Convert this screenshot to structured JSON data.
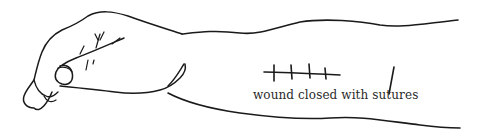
{
  "figure": {
    "caption": "wound closed with sutures",
    "suture_count": 4,
    "colors": {
      "background": "#ffffff",
      "ink": "#1a1a1a",
      "caption_text": "#2a2a2a"
    }
  }
}
